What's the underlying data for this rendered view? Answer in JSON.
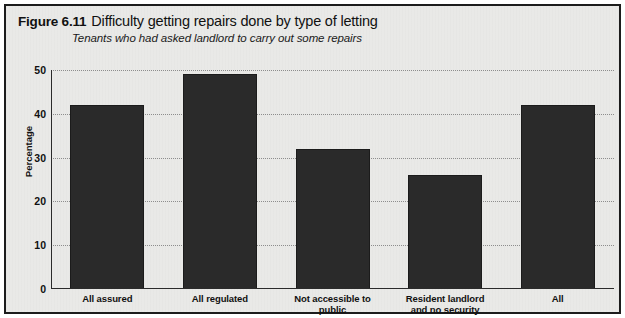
{
  "figure": {
    "number_label": "Figure 6.11",
    "title": "Difficulty getting repairs done by type of letting",
    "subtitle": "Tenants who had asked landlord to carry out some repairs"
  },
  "colors": {
    "bar_fill": "#2a2a2a",
    "frame": "#1c1c1c",
    "panel_background": "#e9e9e7",
    "gridline": "#8d8d8d",
    "text": "#111111"
  },
  "chart_data": {
    "type": "bar",
    "title": "Difficulty getting repairs done by type of letting",
    "subtitle": "Tenants who had asked landlord to carry out some repairs",
    "xlabel": "",
    "ylabel": "Percentage",
    "ylim": [
      0,
      50
    ],
    "yticks": [
      0,
      10,
      20,
      30,
      40,
      50
    ],
    "ytick_labels": [
      "0",
      "10",
      "20",
      "30",
      "40",
      "50"
    ],
    "grid": true,
    "grid_axis": "y",
    "legend": false,
    "categories": [
      "All assured",
      "All regulated",
      "Not accessible to public",
      "Resident landlord and no security",
      "All"
    ],
    "category_label_lines": [
      [
        "All assured"
      ],
      [
        "All regulated"
      ],
      [
        "Not accessible to",
        "public"
      ],
      [
        "Resident landlord",
        "and no security"
      ],
      [
        "All"
      ]
    ],
    "values": [
      42,
      49,
      32,
      26,
      42
    ]
  }
}
